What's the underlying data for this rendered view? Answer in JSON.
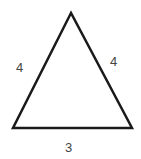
{
  "diagram": {
    "shape": "triangle",
    "stroke_color": "#1a1a1a",
    "vertices": {
      "apex": [
        71,
        13
      ],
      "bottom_left": [
        13,
        128
      ],
      "bottom_right": [
        132,
        128
      ]
    },
    "labels": {
      "left_side": "4",
      "right_side": "4",
      "base": "3"
    }
  }
}
